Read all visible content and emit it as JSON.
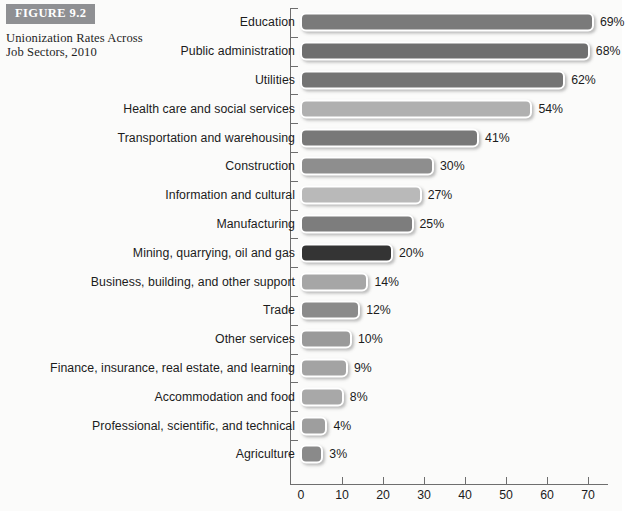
{
  "figure": {
    "badge": "FIGURE 9.2",
    "title": "Unionization Rates Across Job Sectors, 2010"
  },
  "chart_data": {
    "type": "bar",
    "orientation": "horizontal",
    "title": "Unionization Rates Across Job Sectors, 2010",
    "xlabel": "",
    "ylabel": "",
    "xlim": [
      0,
      73
    ],
    "xticks": [
      0,
      10,
      20,
      30,
      40,
      50,
      60,
      70
    ],
    "xtick_labels": [
      "0",
      "10",
      "20",
      "30",
      "40",
      "50",
      "60",
      "70"
    ],
    "grid": false,
    "legend": "none",
    "value_suffix": "%",
    "categories": [
      "Education",
      "Public administration",
      "Utilities",
      "Health care and social services",
      "Transportation and warehousing",
      "Construction",
      "Information and cultural",
      "Manufacturing",
      "Mining, quarrying, oil and gas",
      "Business, building, and other support",
      "Trade",
      "Other services",
      "Finance, insurance, real estate, and learning",
      "Accommodation and food",
      "Professional, scientific, and technical",
      "Agriculture"
    ],
    "values": [
      69,
      68,
      62,
      54,
      41,
      30,
      27,
      25,
      20,
      14,
      12,
      10,
      9,
      8,
      4,
      3
    ],
    "value_labels": [
      "69%",
      "68%",
      "62%",
      "54%",
      "41%",
      "30%",
      "27%",
      "25%",
      "20%",
      "14%",
      "12%",
      "10%",
      "9%",
      "8%",
      "4%",
      "3%"
    ],
    "bar_colors": [
      "#7a7a7a",
      "#6f6f6f",
      "#747474",
      "#b0b0b0",
      "#787878",
      "#8e8e8e",
      "#b9b9b9",
      "#7d7d7d",
      "#343434",
      "#a6a6a6",
      "#8b8b8b",
      "#9a9a9a",
      "#a3a3a3",
      "#a8a8a8",
      "#9e9e9e",
      "#8a8a8a"
    ]
  }
}
